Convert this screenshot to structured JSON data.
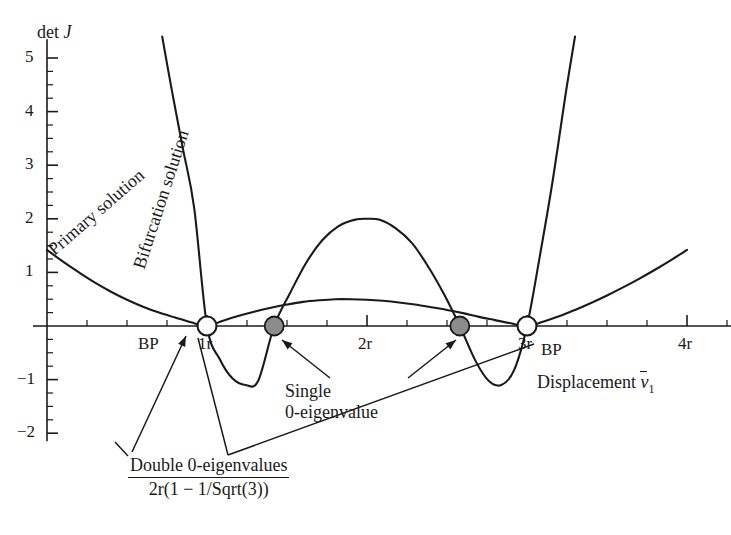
{
  "figure": {
    "title": "",
    "y_axis_label_prefix": "det",
    "y_axis_label_symbol": "J",
    "x_axis_label_prefix": "Displacement",
    "x_axis_label_symbol": "v",
    "x_axis_label_subscript": "1"
  },
  "y_ticks": [
    {
      "value": 5,
      "label": "5"
    },
    {
      "value": 4,
      "label": "4"
    },
    {
      "value": 3,
      "label": "3"
    },
    {
      "value": 2,
      "label": "2"
    },
    {
      "value": 1,
      "label": "1"
    },
    {
      "value": -1,
      "label": "−1"
    },
    {
      "value": -2,
      "label": "−2"
    }
  ],
  "x_ticks": [
    {
      "value": 1,
      "label": "1r"
    },
    {
      "value": 2,
      "label": "2r"
    },
    {
      "value": 3,
      "label": "3r"
    },
    {
      "value": 4,
      "label": "4r"
    }
  ],
  "curve_labels": {
    "primary": "Primary solution",
    "bifurcation": "Bifurcation solution"
  },
  "markers": {
    "bp_labels": [
      "BP",
      "BP"
    ],
    "open_points": [
      {
        "x": 1.0,
        "y": 0
      },
      {
        "x": 3.0,
        "y": 0
      }
    ],
    "filled_points": [
      {
        "x": 1.42,
        "y": 0
      },
      {
        "x": 2.58,
        "y": 0
      }
    ],
    "open_fill": "#ffffff",
    "filled_fill": "#8c8c8c",
    "stroke": "#1a1a1a"
  },
  "annotations": {
    "single": {
      "line1": "Single",
      "line2": "0-eigenvalue"
    },
    "double": {
      "numerator": "Double 0-eigenvalues",
      "denominator": "2r(1 − 1/Sqrt(3))"
    }
  },
  "chart_data": {
    "type": "line",
    "title": "",
    "xlabel": "Displacement v̅1",
    "ylabel": "det J",
    "xlim": [
      0,
      4.3
    ],
    "ylim": [
      -2.3,
      5.4
    ],
    "grid": false,
    "legend": "inline-rotated-labels",
    "xtick_labels": [
      "1r",
      "2r",
      "3r",
      "4r"
    ],
    "xtick_values": [
      1,
      2,
      3,
      4
    ],
    "ytick_labels": [
      "5",
      "4",
      "3",
      "2",
      "1",
      "−1",
      "−2"
    ],
    "ytick_values": [
      5,
      4,
      3,
      2,
      1,
      -1,
      -2
    ],
    "minor_tick_step_x": 0.25,
    "minor_tick_step_y": 0.25,
    "series": [
      {
        "name": "Primary solution",
        "zeros": [
          1.0,
          3.0
        ],
        "comment": "shallow curve: high at left edge, tangent-like dip to 0 at 1r, low hump ~0.5 near 1.85r, back to 0 at 3r, rising right",
        "x": [
          0.0,
          0.1,
          0.2,
          0.3,
          0.4,
          0.5,
          0.6,
          0.7,
          0.8,
          0.9,
          1.0,
          1.1,
          1.2,
          1.3,
          1.4,
          1.5,
          1.6,
          1.7,
          1.8,
          1.9,
          2.0,
          2.1,
          2.2,
          2.3,
          2.4,
          2.5,
          2.6,
          2.7,
          2.8,
          2.9,
          3.0,
          3.1,
          3.2,
          3.3,
          3.4,
          3.5,
          3.6,
          3.7,
          3.8,
          3.9,
          4.0
        ],
        "y": [
          1.42,
          1.2,
          1.0,
          0.81,
          0.64,
          0.49,
          0.36,
          0.25,
          0.16,
          0.07,
          0.0,
          0.1,
          0.19,
          0.27,
          0.34,
          0.4,
          0.45,
          0.48,
          0.5,
          0.5,
          0.49,
          0.47,
          0.44,
          0.4,
          0.35,
          0.3,
          0.24,
          0.17,
          0.11,
          0.05,
          0.0,
          0.08,
          0.18,
          0.3,
          0.43,
          0.57,
          0.72,
          0.88,
          1.05,
          1.23,
          1.42
        ]
      },
      {
        "name": "Bifurcation solution",
        "zeros": [
          1.0,
          1.42,
          2.58,
          3.0
        ],
        "comment": "steep W-shaped quartic: descends from >5 at left through 1r, min -1.1 near 1.2r, peak 2.0 at 2r, min -1.1 near 2.8r, rises steeply past 3r",
        "x": [
          0.72,
          0.78,
          0.85,
          0.92,
          1.0,
          1.08,
          1.16,
          1.24,
          1.32,
          1.42,
          1.52,
          1.62,
          1.72,
          1.82,
          1.92,
          2.0,
          2.08,
          2.18,
          2.28,
          2.38,
          2.48,
          2.58,
          2.68,
          2.76,
          2.84,
          2.92,
          3.0,
          3.08,
          3.16,
          3.24,
          3.3
        ],
        "y": [
          5.4,
          4.4,
          3.3,
          2.2,
          0.0,
          -0.62,
          -0.98,
          -1.1,
          -1.02,
          0.0,
          0.62,
          1.18,
          1.6,
          1.86,
          1.98,
          2.0,
          1.98,
          1.82,
          1.55,
          1.12,
          0.6,
          0.0,
          -0.66,
          -1.02,
          -1.1,
          -0.82,
          0.0,
          1.3,
          2.7,
          4.3,
          5.4
        ]
      }
    ]
  }
}
